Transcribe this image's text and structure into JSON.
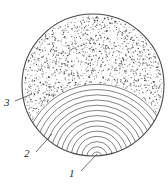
{
  "figure": {
    "background_color": "#ffffff",
    "line_color": "#5a5a5a",
    "outline_color": "#4a4a4a",
    "stipple_color": "#3a3a3a",
    "width": 168,
    "height": 190
  },
  "disc": {
    "center_x": 93,
    "center_y": 85,
    "radius": 71,
    "stroke_width": 1.1
  },
  "pith": {
    "x": 97,
    "y": 157
  },
  "growth_rings": {
    "count": 14,
    "spacing_px": 5.2,
    "first_radius_px": 5
  },
  "stipple": {
    "dot_count": 1500,
    "dot_radius_px": 0.5,
    "region": "upper-zone-above-outermost-ring"
  },
  "callouts": [
    {
      "id": "1",
      "label": "1",
      "name": "callout-1-pith",
      "text_x": 73,
      "text_y": 177,
      "leader": {
        "x1": 81,
        "y1": 171,
        "x2": 97,
        "y2": 154
      }
    },
    {
      "id": "2",
      "label": "2",
      "name": "callout-2-growth-rings",
      "text_x": 28,
      "text_y": 157,
      "leader": {
        "x1": 36,
        "y1": 152,
        "x2": 52,
        "y2": 134
      }
    },
    {
      "id": "3",
      "label": "3",
      "name": "callout-3-stippled-zone",
      "text_x": 8,
      "text_y": 106,
      "leader": {
        "x1": 15,
        "y1": 101,
        "x2": 32,
        "y2": 94
      }
    }
  ]
}
